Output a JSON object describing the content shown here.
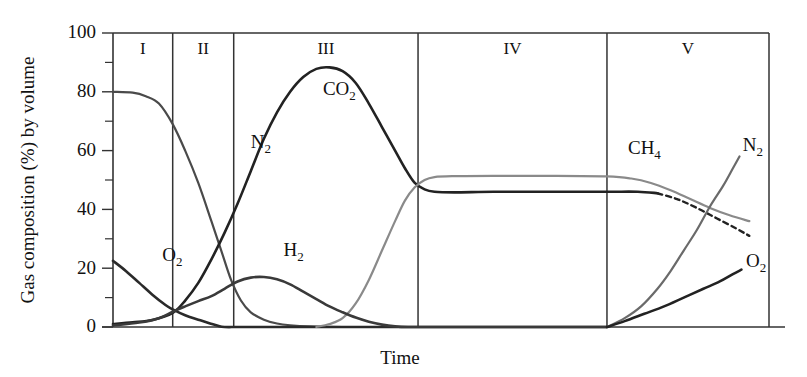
{
  "chart_data": {
    "type": "line",
    "title": "",
    "xlabel": "Time",
    "ylabel": "Gas composition (%) by volume",
    "xlim": [
      0,
      100
    ],
    "ylim": [
      0,
      100
    ],
    "grid": false,
    "legend": "inline-annotations",
    "yticks": [
      0,
      20,
      40,
      60,
      80,
      100
    ],
    "yticklabels": [
      "0",
      "20",
      "40",
      "60",
      "80",
      "100"
    ],
    "yminorticks": [
      10,
      30,
      50,
      70,
      90
    ],
    "xticks": [],
    "xticklabels": [],
    "phases": [
      {
        "label": "I",
        "start": 0.0,
        "end": 9.1
      },
      {
        "label": "II",
        "start": 9.1,
        "end": 18.4
      },
      {
        "label": "III",
        "start": 18.4,
        "end": 46.5
      },
      {
        "label": "IV",
        "start": 46.5,
        "end": 75.3
      },
      {
        "label": "V",
        "start": 75.3,
        "end": 100.0
      }
    ],
    "series": [
      {
        "name": "N2",
        "color": "#4a4a4a",
        "style": "solid",
        "label_x": 21.0,
        "label_y": 61.0,
        "points": [
          [
            0,
            80
          ],
          [
            3,
            79.7
          ],
          [
            5,
            78.5
          ],
          [
            7,
            76
          ],
          [
            9.1,
            69
          ],
          [
            11,
            60
          ],
          [
            13,
            49
          ],
          [
            15,
            36
          ],
          [
            16.5,
            26
          ],
          [
            18,
            16
          ],
          [
            19.5,
            9
          ],
          [
            21,
            5
          ],
          [
            23,
            2.5
          ],
          [
            25,
            1.2
          ],
          [
            27,
            0.6
          ],
          [
            30,
            0.2
          ],
          [
            35,
            0
          ],
          [
            45,
            0
          ],
          [
            60,
            0
          ],
          [
            75.3,
            0
          ]
        ]
      },
      {
        "name": "O2",
        "color": "#2a2a2a",
        "style": "solid",
        "label_x": 7.5,
        "label_y": 22.5,
        "points": [
          [
            0,
            22.5
          ],
          [
            2,
            19
          ],
          [
            4,
            15
          ],
          [
            6,
            11
          ],
          [
            8,
            7.5
          ],
          [
            9.1,
            6
          ],
          [
            11,
            4
          ],
          [
            13,
            2.5
          ],
          [
            14.8,
            1.2
          ],
          [
            16,
            0.4
          ],
          [
            17,
            0
          ],
          [
            20,
            0
          ],
          [
            30,
            0
          ],
          [
            50,
            0
          ],
          [
            75.3,
            0
          ]
        ]
      },
      {
        "name": "CO2",
        "color": "#222222",
        "style": "solid",
        "label_x": 32.0,
        "label_y": 79.0,
        "points": [
          [
            0,
            1
          ],
          [
            3,
            1.6
          ],
          [
            6,
            2.4
          ],
          [
            9.1,
            4.8
          ],
          [
            11,
            9
          ],
          [
            13,
            15
          ],
          [
            15,
            23
          ],
          [
            17,
            32
          ],
          [
            19,
            42
          ],
          [
            21,
            53
          ],
          [
            23,
            64
          ],
          [
            25,
            73
          ],
          [
            27,
            80
          ],
          [
            29,
            85
          ],
          [
            31,
            87.8
          ],
          [
            33,
            88.3
          ],
          [
            35,
            87
          ],
          [
            37,
            83
          ],
          [
            39,
            76
          ],
          [
            41,
            68
          ],
          [
            43,
            60
          ],
          [
            44.5,
            54
          ],
          [
            46,
            49
          ],
          [
            47.5,
            46.8
          ],
          [
            49,
            46
          ],
          [
            52,
            45.8
          ],
          [
            58,
            46
          ],
          [
            66,
            46
          ],
          [
            75.3,
            46
          ],
          [
            80,
            46
          ],
          [
            83,
            45.5
          ],
          [
            86,
            43.5
          ],
          [
            89,
            40.5
          ],
          [
            92,
            37
          ],
          [
            95,
            33.5
          ],
          [
            97,
            31
          ]
        ],
        "dash_from": 83.0
      },
      {
        "name": "CH4",
        "color": "#8a8a8a",
        "style": "solid",
        "label_x": 78.5,
        "label_y": 59.0,
        "points": [
          [
            31,
            0
          ],
          [
            33,
            1
          ],
          [
            35,
            3
          ],
          [
            37,
            8
          ],
          [
            39,
            16
          ],
          [
            41,
            26
          ],
          [
            43,
            36
          ],
          [
            44.5,
            43
          ],
          [
            46,
            47.5
          ],
          [
            47.5,
            50
          ],
          [
            49,
            51
          ],
          [
            52,
            51.3
          ],
          [
            58,
            51.4
          ],
          [
            66,
            51.4
          ],
          [
            75.3,
            51.2
          ],
          [
            79,
            50.5
          ],
          [
            82,
            49
          ],
          [
            85,
            46.5
          ],
          [
            88,
            43.5
          ],
          [
            91,
            40.5
          ],
          [
            94,
            38
          ],
          [
            97,
            36
          ]
        ]
      },
      {
        "name": "H2",
        "color": "#3a3a3a",
        "style": "solid",
        "label_x": 26.0,
        "label_y": 24.0,
        "points": [
          [
            0,
            0.5
          ],
          [
            4,
            1.5
          ],
          [
            7,
            3
          ],
          [
            9.1,
            5.2
          ],
          [
            11,
            7
          ],
          [
            13,
            8.8
          ],
          [
            15,
            10.5
          ],
          [
            17,
            13
          ],
          [
            19,
            15.5
          ],
          [
            21,
            16.8
          ],
          [
            23,
            17
          ],
          [
            25,
            16.2
          ],
          [
            27,
            14.5
          ],
          [
            29,
            12
          ],
          [
            31,
            9.5
          ],
          [
            33,
            7
          ],
          [
            35,
            5
          ],
          [
            37,
            3.2
          ],
          [
            39,
            1.8
          ],
          [
            41,
            0.8
          ],
          [
            43,
            0.2
          ],
          [
            45,
            0
          ],
          [
            50,
            0
          ],
          [
            60,
            0
          ],
          [
            75.3,
            0
          ]
        ]
      },
      {
        "name": "N2_phase5",
        "color": "#6a6a6a",
        "style": "solid",
        "label_x": 96.0,
        "label_y": 60.0,
        "points": [
          [
            75.3,
            0
          ],
          [
            78,
            3
          ],
          [
            80.5,
            7
          ],
          [
            83,
            13
          ],
          [
            85,
            19
          ],
          [
            87,
            26
          ],
          [
            89,
            33
          ],
          [
            91,
            41
          ],
          [
            93,
            48
          ],
          [
            94.5,
            54
          ],
          [
            95.5,
            58
          ]
        ]
      },
      {
        "name": "O2_phase5",
        "color": "#222222",
        "style": "solid",
        "label_x": 96.5,
        "label_y": 20.5,
        "points": [
          [
            75.3,
            0
          ],
          [
            78,
            2
          ],
          [
            81,
            4.5
          ],
          [
            84,
            7
          ],
          [
            87,
            10
          ],
          [
            90,
            13
          ],
          [
            92.5,
            15.5
          ],
          [
            94.5,
            18
          ],
          [
            95.8,
            19.5
          ]
        ]
      }
    ],
    "annotations": [
      {
        "text": "N2",
        "sub": "2",
        "base": "N"
      },
      {
        "text": "O2",
        "sub": "2",
        "base": "O"
      },
      {
        "text": "CO2",
        "sub": "2",
        "base": "CO"
      },
      {
        "text": "CH4",
        "sub": "4",
        "base": "CH"
      },
      {
        "text": "H2",
        "sub": "2",
        "base": "H"
      }
    ]
  },
  "labels": {
    "n2": "N",
    "n2_sub": "2",
    "o2": "O",
    "o2_sub": "2",
    "co2": "CO",
    "co2_sub": "2",
    "ch4": "CH",
    "ch4_sub": "4",
    "h2": "H",
    "h2_sub": "2",
    "n2_right": "N",
    "n2_right_sub": "2",
    "o2_right": "O",
    "o2_right_sub": "2",
    "phase1": "I",
    "phase2": "II",
    "phase3": "III",
    "phase4": "IV",
    "phase5": "V",
    "ytick0": "0",
    "ytick20": "20",
    "ytick40": "40",
    "ytick60": "60",
    "ytick80": "80",
    "ytick100": "100",
    "xtitle": "Time",
    "ytitle": "Gas composition (%) by volume"
  }
}
